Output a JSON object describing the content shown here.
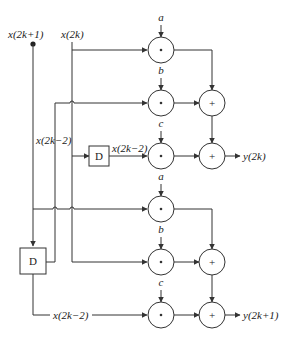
{
  "diagram": {
    "type": "signal-flow / filter structure",
    "inputs": {
      "odd": "x(2k+1)",
      "even": "x(2k)"
    },
    "delay_label": "D",
    "delayed_signal_labels": {
      "side_label": "x(2k−2)",
      "after_delay_top": "x(2k−2)",
      "after_delay_bottom": "x(2k−2)"
    },
    "coefficients": {
      "top": [
        "a",
        "b",
        "c"
      ],
      "bottom": [
        "a",
        "b",
        "c"
      ]
    },
    "multiply_symbol": "*",
    "add_symbol": "+",
    "outputs": {
      "top": "y(2k)",
      "bottom": "y(2k+1)"
    },
    "colors": {
      "line": "#333333",
      "background": "#ffffff"
    }
  }
}
